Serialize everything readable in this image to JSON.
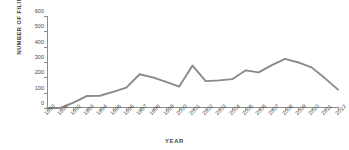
{
  "chart_data": {
    "type": "line",
    "title": "",
    "xlabel": "YEAR",
    "ylabel": "NUMBER OF FILINGS",
    "categories": [
      "1990",
      "1991",
      "1992",
      "1993",
      "1994",
      "1995",
      "1996",
      "1997",
      "1998",
      "1999",
      "2000",
      "2001",
      "2002",
      "2003",
      "2004",
      "2005",
      "2006",
      "2007",
      "2008",
      "2009",
      "2010",
      "2011",
      "2012"
    ],
    "values": [
      0,
      0,
      35,
      78,
      80,
      105,
      133,
      220,
      200,
      170,
      140,
      277,
      175,
      180,
      188,
      245,
      232,
      280,
      320,
      297,
      265,
      195,
      120
    ],
    "series": [
      {
        "name": "Number of Filings",
        "values": [
          0,
          0,
          35,
          78,
          80,
          105,
          133,
          220,
          200,
          170,
          140,
          277,
          175,
          180,
          188,
          245,
          232,
          280,
          320,
          297,
          265,
          195,
          120
        ]
      }
    ],
    "ylim": [
      0,
      600
    ],
    "yticks": [
      0,
      100,
      200,
      300,
      400,
      500,
      600
    ],
    "ytick_labels": [
      "0",
      "100",
      "200",
      "300",
      "400",
      "500",
      "600"
    ],
    "xlim": [
      "1990",
      "2012"
    ],
    "grid": false,
    "legend": null,
    "legend_position": "none",
    "line_color": "#8a8a8a",
    "axis_color": "#8a8a8a",
    "text_color": "#4a4a4a",
    "background": "#ffffff"
  }
}
